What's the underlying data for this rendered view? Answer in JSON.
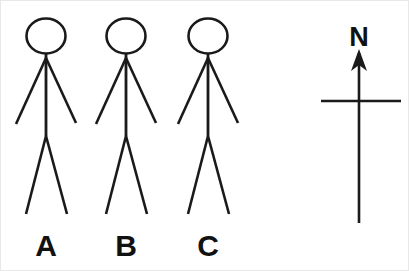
{
  "canvas": {
    "width": 409,
    "height": 271,
    "background_color": "#ffffff",
    "stroke_color": "#1a1a1a",
    "text_color": "#111111"
  },
  "figures": [
    {
      "id": "figure-a",
      "label": "A",
      "label_x": 45,
      "label_y": 255,
      "center_x": 45,
      "head": {
        "cx": 45,
        "cy": 35,
        "rx": 19.5,
        "ry": 17.5,
        "stroke_width": 2.6
      },
      "torso": {
        "x1": 45,
        "y1": 52,
        "x2": 45,
        "y2": 135,
        "stroke_width": 2.8
      },
      "arm_left": {
        "x1": 45,
        "y1": 57,
        "x2": 15,
        "y2": 123,
        "stroke_width": 2.6
      },
      "arm_right": {
        "x1": 45,
        "y1": 57,
        "x2": 75,
        "y2": 122,
        "stroke_width": 2.6
      },
      "leg_left": {
        "x1": 45,
        "y1": 135,
        "x2": 25,
        "y2": 213,
        "stroke_width": 2.6
      },
      "leg_right": {
        "x1": 45,
        "y1": 135,
        "x2": 66,
        "y2": 213,
        "stroke_width": 2.6
      }
    },
    {
      "id": "figure-b",
      "label": "B",
      "label_x": 125,
      "label_y": 255,
      "center_x": 125,
      "head": {
        "cx": 125,
        "cy": 35,
        "rx": 19.5,
        "ry": 17.5,
        "stroke_width": 2.6
      },
      "torso": {
        "x1": 125,
        "y1": 52,
        "x2": 125,
        "y2": 135,
        "stroke_width": 2.8
      },
      "arm_left": {
        "x1": 125,
        "y1": 57,
        "x2": 95,
        "y2": 123,
        "stroke_width": 2.6
      },
      "arm_right": {
        "x1": 125,
        "y1": 57,
        "x2": 155,
        "y2": 122,
        "stroke_width": 2.6
      },
      "leg_left": {
        "x1": 125,
        "y1": 135,
        "x2": 105,
        "y2": 213,
        "stroke_width": 2.6
      },
      "leg_right": {
        "x1": 125,
        "y1": 135,
        "x2": 146,
        "y2": 213,
        "stroke_width": 2.6
      }
    },
    {
      "id": "figure-c",
      "label": "C",
      "label_x": 207,
      "label_y": 255,
      "center_x": 207,
      "head": {
        "cx": 207,
        "cy": 35,
        "rx": 19.5,
        "ry": 17.5,
        "stroke_width": 2.6
      },
      "torso": {
        "x1": 207,
        "y1": 52,
        "x2": 207,
        "y2": 135,
        "stroke_width": 2.8
      },
      "arm_left": {
        "x1": 207,
        "y1": 57,
        "x2": 177,
        "y2": 123,
        "stroke_width": 2.6
      },
      "arm_right": {
        "x1": 207,
        "y1": 57,
        "x2": 237,
        "y2": 122,
        "stroke_width": 2.6
      },
      "leg_left": {
        "x1": 207,
        "y1": 135,
        "x2": 187,
        "y2": 213,
        "stroke_width": 2.6
      },
      "leg_right": {
        "x1": 207,
        "y1": 135,
        "x2": 228,
        "y2": 213,
        "stroke_width": 2.6
      }
    }
  ],
  "compass": {
    "id": "compass-rose",
    "north_label": "N",
    "label_x": 358,
    "label_y": 45,
    "needle": {
      "x1": 358,
      "y1": 52,
      "x2": 358,
      "y2": 222,
      "stroke_width": 2.6
    },
    "crossbar": {
      "x1": 320,
      "y1": 100,
      "x2": 400,
      "y2": 100,
      "stroke_width": 2.4
    },
    "arrowhead": {
      "points": "358,48 350,70 358,64 366,70",
      "tip_x": 358,
      "tip_y": 48
    }
  }
}
